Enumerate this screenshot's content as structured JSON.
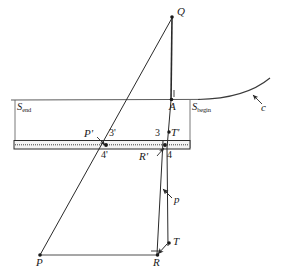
{
  "figure": {
    "background_color": "#ffffff",
    "line_color": "#2a2a2a",
    "width": 284,
    "height": 271
  },
  "labels": {
    "q": "Q",
    "a": "A",
    "s_end_base": "S",
    "s_end_sub": "end",
    "s_begin_base": "S",
    "s_begin_sub": "begin",
    "c": "c",
    "p_prime": "P'",
    "three_prime": "3'",
    "four_prime": "4'",
    "three": "3",
    "four": "4",
    "t_prime": "T'",
    "r_prime": "R'",
    "p_vector": "p",
    "t": "T",
    "p": "P",
    "r": "R"
  },
  "points": {
    "Q": {
      "x": 172,
      "y": 17
    },
    "A": {
      "x": 172,
      "y": 100
    },
    "P_prime": {
      "x": 106,
      "y": 145
    },
    "R_prime": {
      "x": 165,
      "y": 145
    },
    "T_point": {
      "x": 168,
      "y": 245
    },
    "P": {
      "x": 40,
      "y": 255
    },
    "R": {
      "x": 157,
      "y": 255
    }
  },
  "slab": {
    "left": 14,
    "right": 190,
    "top": 140,
    "bottom": 149,
    "center_dotted": true
  },
  "baseline": {
    "y": 100,
    "x_start": 11,
    "x_end": 200
  }
}
